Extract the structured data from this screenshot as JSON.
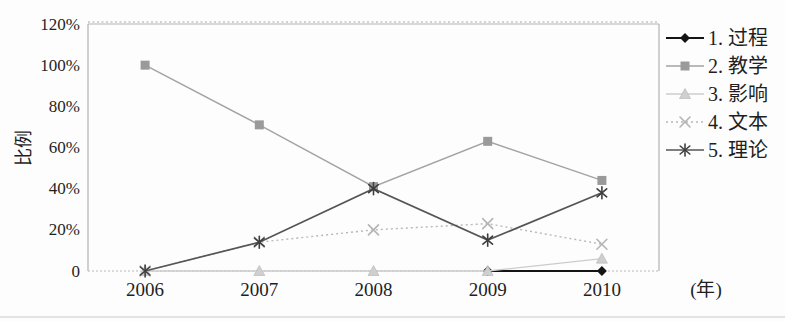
{
  "figure": {
    "background": "#fdfdfd",
    "scan_edge_color": "#c8c8c8"
  },
  "chart_data": {
    "type": "line",
    "title": "",
    "categories": [
      "2006",
      "2007",
      "2008",
      "2009",
      "2010"
    ],
    "x_axis_unit_label": "(年)",
    "ylabel": "比例",
    "ylim": [
      0,
      120
    ],
    "y_tick_step": 20,
    "y_tick_labels": [
      "0",
      "20%",
      "40%",
      "60%",
      "80%",
      "100%",
      "120%"
    ],
    "grid": "top gridline dotted, baseline dotted, no interior gridlines",
    "legend_position": "right-outside",
    "plot_border_color": "#b3b3b3",
    "gridline_color": "#ababab",
    "series": [
      {
        "name": "1. 过程",
        "marker": "diamond",
        "line_style": "solid",
        "color": "#141414",
        "marker_color": "#141414",
        "values": [
          null,
          null,
          null,
          0,
          0
        ]
      },
      {
        "name": "2. 教学",
        "marker": "square",
        "line_style": "solid",
        "color": "#a3a3a3",
        "marker_color": "#9a9a9a",
        "values": [
          100,
          71,
          41,
          63,
          44
        ]
      },
      {
        "name": "3. 影响",
        "marker": "triangle",
        "line_style": "solid",
        "color": "#cccccc",
        "marker_color": "#cfcfcf",
        "values": [
          0,
          0,
          0,
          0,
          6
        ]
      },
      {
        "name": "4. 文本",
        "marker": "x",
        "line_style": "dotted",
        "color": "#b8b8b8",
        "marker_color": "#b5b5b5",
        "values": [
          0,
          14,
          20,
          23,
          13
        ]
      },
      {
        "name": "5. 理论",
        "marker": "asterisk",
        "line_style": "solid",
        "color": "#555555",
        "marker_color": "#3f3f3f",
        "values": [
          0,
          14,
          40,
          15,
          38
        ]
      }
    ]
  }
}
